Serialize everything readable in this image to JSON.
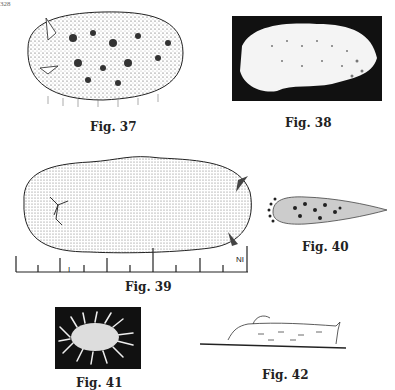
{
  "page": {
    "page_number": "328",
    "figures": [
      {
        "id": "fig37",
        "caption": "Fig. 37"
      },
      {
        "id": "fig38",
        "caption": "Fig. 38"
      },
      {
        "id": "fig39",
        "caption": "Fig. 39",
        "scale_labels": [
          "I",
          "NI"
        ]
      },
      {
        "id": "fig40",
        "caption": "Fig. 40"
      },
      {
        "id": "fig41",
        "caption": "Fig. 41"
      },
      {
        "id": "fig42",
        "caption": "Fig. 42"
      }
    ]
  }
}
